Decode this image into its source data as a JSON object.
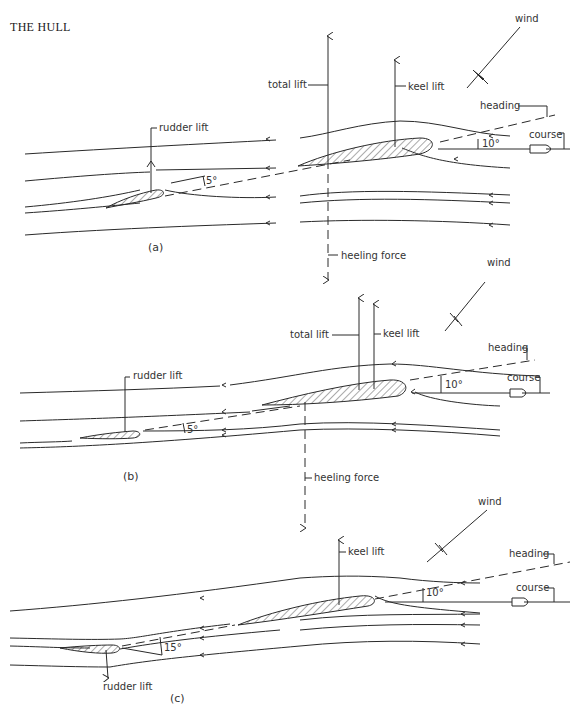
{
  "header": {
    "title": "THE HULL"
  },
  "labels": {
    "wind": "wind",
    "heading": "heading",
    "course": "course",
    "total_lift": "total lift",
    "keel_lift": "keel lift",
    "rudder_lift": "rudder lift",
    "heeling_force": "heeling force"
  },
  "panels": [
    {
      "id": "a",
      "caption": "(a)",
      "heading_angle": "10°",
      "rudder_angle": "5°",
      "labels_shown": [
        "wind",
        "heading",
        "course",
        "total lift",
        "keel lift",
        "rudder lift",
        "heeling force"
      ]
    },
    {
      "id": "b",
      "caption": "(b)",
      "heading_angle": "10°",
      "rudder_angle": "5°",
      "labels_shown": [
        "wind",
        "heading",
        "course",
        "total lift",
        "keel lift",
        "rudder lift",
        "heeling force"
      ]
    },
    {
      "id": "c",
      "caption": "(c)",
      "heading_angle": "10°",
      "rudder_angle": "15°",
      "labels_shown": [
        "wind",
        "heading",
        "course",
        "keel lift",
        "rudder lift"
      ]
    }
  ],
  "colors": {
    "ink": "#2a2a2a",
    "background": "#ffffff"
  }
}
